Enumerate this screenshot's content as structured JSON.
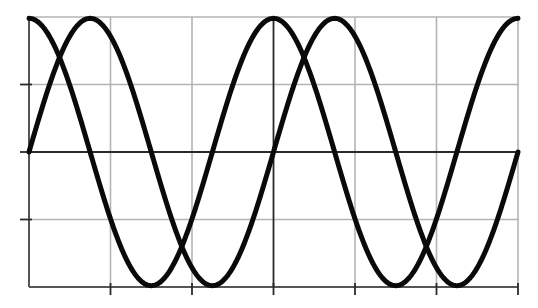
{
  "chart_data": {
    "type": "line",
    "title": "",
    "xlabel": "",
    "ylabel": "",
    "xlim": [
      -6.2832,
      6.2832
    ],
    "ylim": [
      -1,
      1
    ],
    "x_ticks": [
      "-4π/3",
      "-2π/3",
      "0",
      "2π/3",
      "4π/3",
      "2π"
    ],
    "x_tick_values": [
      -4.1888,
      -2.0944,
      0,
      2.0944,
      4.1888,
      6.2832
    ],
    "y_ticks": [
      -0.5,
      0.5
    ],
    "tick_labels_visible": false,
    "grid": true,
    "legend": null,
    "series": [
      {
        "name": "cos(x)",
        "function": "cos",
        "color": "#0a0a0a",
        "x": [
          -6.2832,
          -5.4978,
          -4.7124,
          -3.927,
          -3.1416,
          -2.3562,
          -1.5708,
          -0.7854,
          0,
          0.7854,
          1.5708,
          2.3562,
          3.1416,
          3.927,
          4.7124,
          5.4978,
          6.2832
        ],
        "values": [
          1,
          0.707,
          0,
          -0.707,
          -1,
          -0.707,
          0,
          0.707,
          1,
          0.707,
          0,
          -0.707,
          -1,
          -0.707,
          0,
          0.707,
          1
        ]
      },
      {
        "name": "sin(x)",
        "function": "sin",
        "color": "#0a0a0a",
        "x": [
          -6.2832,
          -5.4978,
          -4.7124,
          -3.927,
          -3.1416,
          -2.3562,
          -1.5708,
          -0.7854,
          0,
          0.7854,
          1.5708,
          2.3562,
          3.1416,
          3.927,
          4.7124,
          5.4978,
          6.2832
        ],
        "values": [
          0,
          0.707,
          1,
          0.707,
          0,
          -0.707,
          -1,
          -0.707,
          0,
          0.707,
          1,
          0.707,
          0,
          -0.707,
          -1,
          -0.707,
          0
        ]
      }
    ],
    "layout": {
      "plot_left_px": 29,
      "plot_right_px": 518,
      "plot_top_px": 17,
      "plot_bottom_px": 287,
      "x_zero_px": 272,
      "y_zero_px": 152
    }
  }
}
